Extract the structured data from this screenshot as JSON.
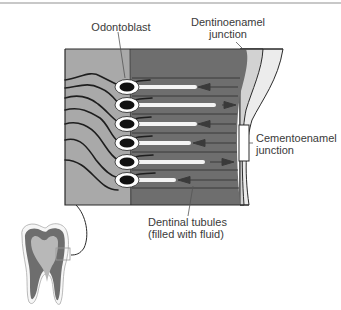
{
  "figure": {
    "labels": {
      "odontoblast": "Odontoblast",
      "dej_line1": "Dentinoenamel",
      "dej_line2": "junction",
      "cej_line1": "Cementoenamel",
      "cej_line2": "junction",
      "tubules_line1": "Dentinal tubules",
      "tubules_line2": "(filled with fluid)"
    },
    "odontoblasts": [
      {
        "y": 87,
        "process_length": 63,
        "fluid_flow": "inward"
      },
      {
        "y": 105,
        "process_length": 82,
        "fluid_flow": "outward"
      },
      {
        "y": 124,
        "process_length": 63,
        "fluid_flow": "inward"
      },
      {
        "y": 143,
        "process_length": 57,
        "fluid_flow": "inward"
      },
      {
        "y": 162,
        "process_length": 71,
        "fluid_flow": "outward"
      },
      {
        "y": 180,
        "process_length": 42,
        "fluid_flow": "inward"
      }
    ],
    "colors": {
      "pulp": "#a9a9a9",
      "dentin": "#6e6e6e",
      "enamel_inner": "#d2d2d2",
      "enamel_outer": "#ececec",
      "outline": "#2a2a2a",
      "odontoblast_nucleus": "#111111",
      "odontoblast_body": "#ffffff"
    }
  }
}
